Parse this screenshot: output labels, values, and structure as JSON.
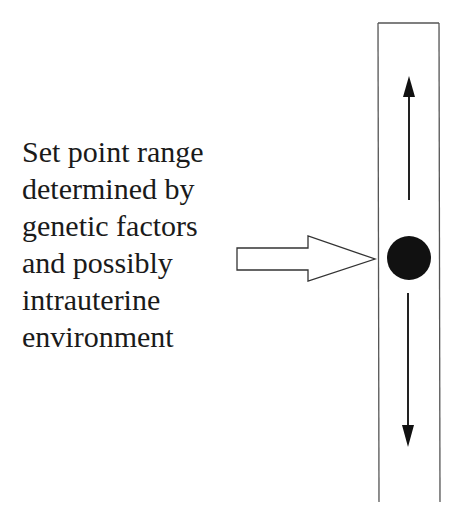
{
  "label": {
    "lines": [
      "Set point range",
      "determined by",
      "genetic factors",
      "and possibly",
      "intrauterine",
      "environment"
    ]
  },
  "diagram": {
    "elements": [
      {
        "type": "text-block",
        "name": "set-point-label"
      },
      {
        "type": "block-arrow",
        "direction": "right",
        "fill": "#ffffff",
        "stroke": "#333333"
      },
      {
        "type": "vertical-range-bar",
        "stroke": "#555555"
      },
      {
        "type": "set-point-dot",
        "fill": "#111111"
      },
      {
        "type": "arrow",
        "direction": "up"
      },
      {
        "type": "arrow",
        "direction": "down"
      }
    ]
  }
}
